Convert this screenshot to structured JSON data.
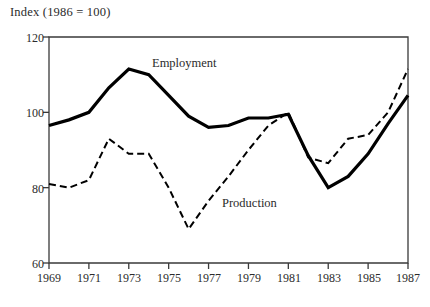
{
  "chart_data": {
    "type": "line",
    "title": "Index (1986 = 100)",
    "xlabel": "",
    "ylabel": "Index (1986 = 100)",
    "xlim": [
      1969,
      1987
    ],
    "ylim": [
      60,
      120
    ],
    "grid": false,
    "legend_position": "inline-annotations",
    "y_ticks": [
      60,
      80,
      100,
      120
    ],
    "y_tick_labels": [
      "60",
      "80",
      "100",
      "120"
    ],
    "x_ticks": [
      1969,
      1971,
      1973,
      1975,
      1977,
      1979,
      1981,
      1983,
      1985,
      1987
    ],
    "x_tick_labels": [
      "1969",
      "1971",
      "1973",
      "1975",
      "1977",
      "1979",
      "1981",
      "1983",
      "1985",
      "1987"
    ],
    "x": [
      1969,
      1970,
      1971,
      1972,
      1973,
      1974,
      1975,
      1976,
      1977,
      1978,
      1979,
      1980,
      1981,
      1982,
      1983,
      1984,
      1985,
      1986,
      1987
    ],
    "series": [
      {
        "name": "Employment",
        "style": "solid",
        "color": "#000000",
        "width": 3.2,
        "values": [
          96.5,
          98.0,
          100.0,
          106.5,
          111.5,
          110.0,
          104.5,
          99.0,
          96.0,
          96.5,
          98.5,
          98.5,
          99.5,
          88.5,
          80.0,
          83.0,
          89.0,
          97.0,
          104.5
        ]
      },
      {
        "name": "Production",
        "style": "dashed",
        "color": "#000000",
        "width": 2.0,
        "values": [
          81.0,
          80.0,
          82.0,
          93.0,
          89.0,
          89.0,
          80.0,
          69.0,
          76.5,
          83.0,
          90.0,
          96.5,
          100.0,
          88.0,
          86.5,
          93.0,
          94.0,
          100.0,
          111.5
        ]
      }
    ],
    "annotations": [
      {
        "text": "Employment",
        "x": 1973.6,
        "y": 113.5
      },
      {
        "text": "Production",
        "x": 1977.2,
        "y": 73.5
      }
    ]
  },
  "axes": {
    "frame_color": "#3a3a3a",
    "tick_color": "#3a3a3a"
  }
}
